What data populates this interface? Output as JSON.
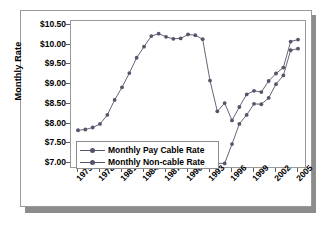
{
  "chart_data": {
    "type": "line",
    "title": "",
    "xlabel": "",
    "ylabel": "Monthly Rate",
    "ylim": [
      7.0,
      10.5
    ],
    "xlim": [
      1975,
      2005
    ],
    "grid": false,
    "legend_position": "inside-lower-left",
    "ytick_labels": [
      "$10.50",
      "$10.00",
      "$9.50",
      "$9.00",
      "$8.50",
      "$8.00",
      "$7.50",
      "$7.00"
    ],
    "ytick_values": [
      10.5,
      10.0,
      9.5,
      9.0,
      8.5,
      8.0,
      7.5,
      7.0
    ],
    "xtick_labels": [
      "1975",
      "1978",
      "1981",
      "1984",
      "1987",
      "1990",
      "1993",
      "1996",
      "1999",
      "2002",
      "2005"
    ],
    "xtick_values": [
      1975,
      1978,
      1981,
      1984,
      1987,
      1990,
      1993,
      1996,
      1999,
      2002,
      2005
    ],
    "series": [
      {
        "name": "Monthly Pay Cable Rate",
        "color": "#55556a",
        "marker": "circle",
        "x": [
          1975,
          1976,
          1977,
          1978,
          1979,
          1980,
          1981,
          1982,
          1983,
          1984,
          1985,
          1986,
          1987,
          1988,
          1989,
          1990,
          1991,
          1992,
          1993,
          1994,
          1995,
          1996,
          1997,
          1998,
          1999,
          2000,
          2001,
          2002,
          2003,
          2004,
          2005
        ],
        "values": [
          7.83,
          7.85,
          7.9,
          7.99,
          8.22,
          8.6,
          8.92,
          9.28,
          9.67,
          9.95,
          10.22,
          10.28,
          10.2,
          10.15,
          10.16,
          10.26,
          10.24,
          10.14,
          9.09,
          8.31,
          8.52,
          8.08,
          8.42,
          8.74,
          8.83,
          8.8,
          9.08,
          9.27,
          9.42,
          10.08,
          10.13
        ]
      },
      {
        "name": "Monthly Non-cable Rate",
        "color": "#55556a",
        "marker": "circle",
        "x": [
          1994,
          1995,
          1996,
          1997,
          1998,
          1999,
          2000,
          2001,
          2002,
          2003,
          2004,
          2005
        ],
        "values": [
          6.99,
          6.99,
          7.48,
          7.99,
          8.22,
          8.5,
          8.49,
          8.65,
          9.0,
          9.22,
          9.86,
          9.9
        ]
      }
    ]
  },
  "legend": {
    "items": [
      {
        "label": "Monthly Pay Cable Rate"
      },
      {
        "label": "Monthly Non-cable Rate"
      }
    ]
  }
}
